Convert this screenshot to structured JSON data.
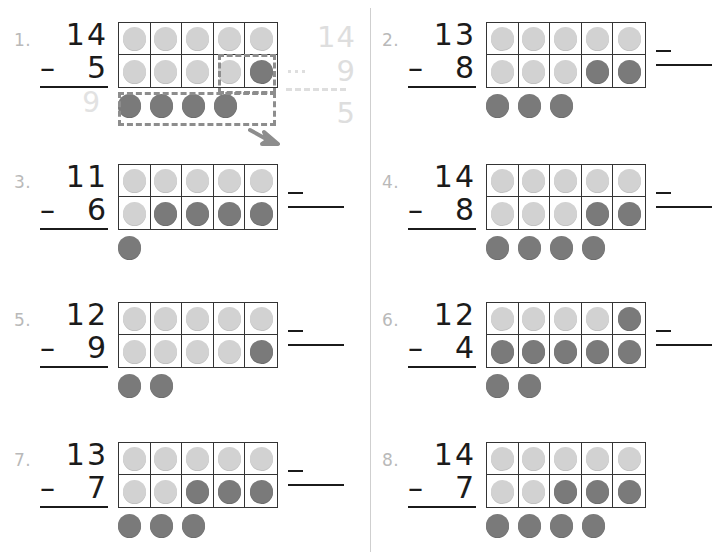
{
  "page": {
    "columns": 2,
    "counter_colors": {
      "light": "#d2d2d2",
      "dark": "#7a7a7a",
      "frame_border": "#343434",
      "number_ink": "#1b1b1b",
      "problem_number_ink": "#b9b9b9",
      "annotation": "#8d8d8d",
      "traced": "#dedede"
    }
  },
  "annotation": {
    "example_minuend": "14",
    "example_operator": "–",
    "example_subtrahend": "9",
    "example_difference": "5",
    "traced_answer": "9",
    "box_label": "dashed-highlight-box",
    "arrow_label": "arrow-pointing-right-down"
  },
  "problems": [
    {
      "number": "1.",
      "minuend": "14",
      "operator": "–",
      "subtrahend": "5",
      "answer": "9",
      "answer_is_traced": true,
      "has_answer_blank": false,
      "has_annotations": true,
      "frame_row1": [
        "light",
        "light",
        "light",
        "light",
        "light"
      ],
      "frame_row2": [
        "light",
        "light",
        "light",
        "light",
        "dark"
      ],
      "extra": [
        "dark",
        "dark",
        "dark",
        "dark"
      ]
    },
    {
      "number": "2.",
      "minuend": "13",
      "operator": "–",
      "subtrahend": "8",
      "answer": "",
      "answer_is_traced": false,
      "has_answer_blank": true,
      "has_annotations": false,
      "frame_row1": [
        "light",
        "light",
        "light",
        "light",
        "light"
      ],
      "frame_row2": [
        "light",
        "light",
        "light",
        "dark",
        "dark"
      ],
      "extra": [
        "dark",
        "dark",
        "dark"
      ]
    },
    {
      "number": "3.",
      "minuend": "11",
      "operator": "–",
      "subtrahend": "6",
      "answer": "",
      "answer_is_traced": false,
      "has_answer_blank": true,
      "has_annotations": false,
      "frame_row1": [
        "light",
        "light",
        "light",
        "light",
        "light"
      ],
      "frame_row2": [
        "light",
        "dark",
        "dark",
        "dark",
        "dark"
      ],
      "extra": [
        "dark"
      ]
    },
    {
      "number": "4.",
      "minuend": "14",
      "operator": "–",
      "subtrahend": "8",
      "answer": "",
      "answer_is_traced": false,
      "has_answer_blank": true,
      "has_annotations": false,
      "frame_row1": [
        "light",
        "light",
        "light",
        "light",
        "light"
      ],
      "frame_row2": [
        "light",
        "light",
        "light",
        "dark",
        "dark"
      ],
      "extra": [
        "dark",
        "dark",
        "dark",
        "dark"
      ]
    },
    {
      "number": "5.",
      "minuend": "12",
      "operator": "–",
      "subtrahend": "9",
      "answer": "",
      "answer_is_traced": false,
      "has_answer_blank": true,
      "has_annotations": false,
      "frame_row1": [
        "light",
        "light",
        "light",
        "light",
        "light"
      ],
      "frame_row2": [
        "light",
        "light",
        "light",
        "light",
        "dark"
      ],
      "extra": [
        "dark",
        "dark"
      ]
    },
    {
      "number": "6.",
      "minuend": "12",
      "operator": "–",
      "subtrahend": "4",
      "answer": "",
      "answer_is_traced": false,
      "has_answer_blank": true,
      "has_annotations": false,
      "frame_row1": [
        "light",
        "light",
        "light",
        "light",
        "dark"
      ],
      "frame_row2": [
        "dark",
        "dark",
        "dark",
        "dark",
        "dark"
      ],
      "extra": [
        "dark",
        "dark"
      ]
    },
    {
      "number": "7.",
      "minuend": "13",
      "operator": "–",
      "subtrahend": "7",
      "answer": "",
      "answer_is_traced": false,
      "has_answer_blank": true,
      "has_annotations": false,
      "frame_row1": [
        "light",
        "light",
        "light",
        "light",
        "light"
      ],
      "frame_row2": [
        "light",
        "light",
        "dark",
        "dark",
        "dark"
      ],
      "extra": [
        "dark",
        "dark",
        "dark"
      ]
    },
    {
      "number": "8.",
      "minuend": "14",
      "operator": "–",
      "subtrahend": "7",
      "answer": "",
      "answer_is_traced": false,
      "has_answer_blank": false,
      "has_annotations": false,
      "frame_row1": [
        "light",
        "light",
        "light",
        "light",
        "light"
      ],
      "frame_row2": [
        "light",
        "light",
        "dark",
        "dark",
        "dark"
      ],
      "extra": [
        "dark",
        "dark",
        "dark",
        "dark"
      ]
    }
  ]
}
